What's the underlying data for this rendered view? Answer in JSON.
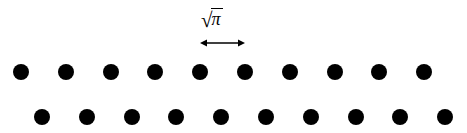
{
  "figure": {
    "background_color": "#ffffff",
    "foreground_color": "#000000",
    "width": 467,
    "height": 133
  },
  "annotation": {
    "label_text": "√π",
    "radical_sign": "√",
    "radicand": "π",
    "label_x": 200,
    "label_y": 8,
    "arrow_label": "lattice-spacing",
    "arrow": {
      "x_start": 200,
      "x_end": 245,
      "y": 43,
      "length": 45,
      "style": "double-headed"
    }
  },
  "chart_data": {
    "type": "scatter",
    "title": "",
    "xlabel": "",
    "ylabel": "",
    "grid": false,
    "legend": null,
    "xlim": [
      0,
      467
    ],
    "ylim": [
      0,
      133
    ],
    "annotations": [
      {
        "text": "√π",
        "x": 222,
        "y": 18,
        "type": "dimension-label"
      },
      {
        "type": "double-arrow",
        "x_start": 200,
        "x_end": 245,
        "y": 43,
        "measures": "√π"
      }
    ],
    "marker": {
      "shape": "circle",
      "color": "#000000",
      "diameter": 16
    },
    "series": [
      {
        "name": "row-1",
        "row_index": 0,
        "count": 10,
        "y": 72,
        "x_start": 21,
        "spacing": 44.8,
        "x": [
          21,
          65.8,
          110.6,
          155.4,
          200.2,
          245.0,
          289.8,
          334.6,
          379.4,
          424.2
        ],
        "values": [
          72,
          72,
          72,
          72,
          72,
          72,
          72,
          72,
          72,
          72
        ]
      },
      {
        "name": "row-2",
        "row_index": 1,
        "count": 10,
        "y": 117,
        "x_start": 42,
        "spacing": 44.8,
        "x": [
          42,
          86.8,
          131.6,
          176.4,
          221.2,
          266.0,
          310.8,
          355.6,
          400.4,
          445.2
        ],
        "values": [
          117,
          117,
          117,
          117,
          117,
          117,
          117,
          117,
          117,
          117
        ]
      }
    ]
  }
}
